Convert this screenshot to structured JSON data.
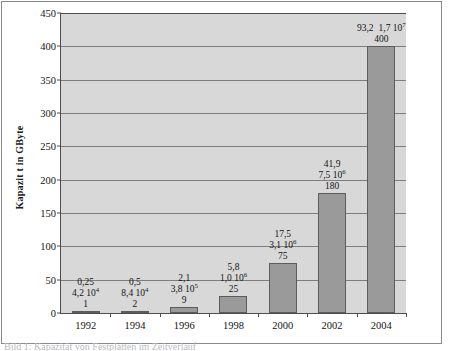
{
  "figure": {
    "bottom_caption": "Bild 1: Kapazität von Festplatten im Zeitverlauf"
  },
  "chart_data": {
    "type": "bar",
    "title": "",
    "xlabel": "",
    "ylabel": "Kapazit t in GByte",
    "ylim": [
      0,
      450
    ],
    "ytick_step": 50,
    "grid": true,
    "legend": "none",
    "bar_color": "#9a9a9a",
    "plot_background": "#d8d8d8",
    "categories": [
      "1992",
      "1994",
      "1996",
      "1998",
      "2000",
      "2002",
      "2004"
    ],
    "values": [
      1,
      2,
      9,
      25,
      75,
      180,
      400
    ],
    "ytick_labels": [
      "0",
      "50",
      "100",
      "150",
      "200",
      "250",
      "300",
      "350",
      "400",
      "450"
    ],
    "ytick_values": [
      0,
      50,
      100,
      150,
      200,
      250,
      300,
      350,
      400,
      450
    ],
    "point_labels": [
      {
        "category": "1992",
        "line1": "0,25",
        "line2_mantissa": "4,2 10",
        "line2_exponent": "4",
        "line3": "1"
      },
      {
        "category": "1994",
        "line1": "0,5",
        "line2_mantissa": "8,4 10",
        "line2_exponent": "4",
        "line3": "2"
      },
      {
        "category": "1996",
        "line1": "2,1",
        "line2_mantissa": "3,8 10",
        "line2_exponent": "5",
        "line3": "9"
      },
      {
        "category": "1998",
        "line1": "5,8",
        "line2_mantissa": "1,0 10",
        "line2_exponent": "6",
        "line3": "25"
      },
      {
        "category": "2000",
        "line1": "17,5",
        "line2_mantissa": "3,1 10",
        "line2_exponent": "6",
        "line3": "75"
      },
      {
        "category": "2002",
        "line1": "41,9",
        "line2_mantissa": "7,5 10",
        "line2_exponent": "6",
        "line3": "180"
      },
      {
        "category": "2004",
        "line1": "93,2",
        "line2_mantissa": "1,7 10",
        "line2_exponent": "7",
        "line3": "400"
      }
    ]
  }
}
